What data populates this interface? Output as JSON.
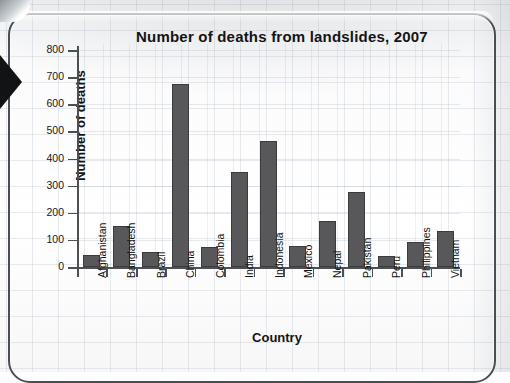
{
  "chart_data": {
    "type": "bar",
    "title": "Number of deaths from landslides, 2007",
    "xlabel": "Country",
    "ylabel": "Number of deaths",
    "categories": [
      "Afghanistan",
      "Bangladesh",
      "Brazil",
      "China",
      "Colombia",
      "India",
      "Indonesia",
      "Mexico",
      "Nepal",
      "Pakistan",
      "Peru",
      "Philippines",
      "Vietnam"
    ],
    "values": [
      45,
      150,
      55,
      675,
      72,
      350,
      465,
      77,
      170,
      277,
      42,
      92,
      132
    ],
    "ylim": [
      0,
      800
    ],
    "ytick_labels": [
      "0",
      "100",
      "200",
      "300",
      "400",
      "500",
      "600",
      "700",
      "800"
    ],
    "ytick_values": [
      0,
      100,
      200,
      300,
      400,
      500,
      600,
      700,
      800
    ],
    "grid": true,
    "legend": "none",
    "bar_color": "#58585a",
    "bar_edge_color": "#3b3b3d",
    "axis_color": "#4d5053",
    "text_color": "#141414",
    "background_color": "#ffffff"
  },
  "page": {
    "frame_color": "#4a4e52",
    "pointer_color": "#111315",
    "sheet_description": "graph paper worksheet"
  }
}
